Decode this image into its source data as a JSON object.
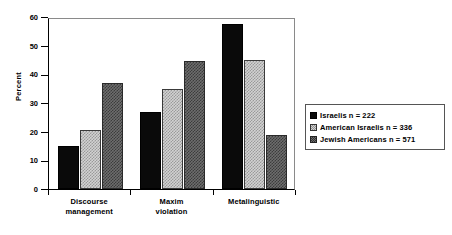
{
  "chart_data": {
    "type": "bar",
    "title": "",
    "subtitle": "",
    "xlabel": "",
    "ylabel": "Percent",
    "categories": [
      "Discourse\nmanagement",
      "Maxim\nviolation",
      "Metalinguistic"
    ],
    "category_lines": [
      [
        "Discourse",
        "management"
      ],
      [
        "Maxim",
        "violation"
      ],
      [
        "Metalinguistic"
      ]
    ],
    "series": [
      {
        "name": "Israelis  n = 222",
        "group": "Israelis",
        "n": 222,
        "values": [
          15,
          27,
          57.5
        ],
        "color": "#0a0a0a",
        "pattern": "solid-black"
      },
      {
        "name": "American  Israelis  n = 336",
        "group": "American Israelis",
        "n": 336,
        "values": [
          20.5,
          35,
          45
        ],
        "color": "#d2d2d2",
        "pattern": "light-checker"
      },
      {
        "name": "Jewish  Americans  n = 571",
        "group": "Jewish Americans",
        "n": 571,
        "values": [
          37,
          44.5,
          19
        ],
        "color": "#6d6d6d",
        "pattern": "dark-checker"
      }
    ],
    "ylim": [
      0,
      60
    ],
    "yticks": [
      0,
      10,
      20,
      30,
      40,
      50,
      60
    ],
    "ytick_labels": [
      "0",
      "10",
      "20",
      "30",
      "40",
      "50",
      "60"
    ],
    "grid": false,
    "legend_position": "right"
  },
  "legend": {
    "entries": [
      {
        "label": "Israelis  n = 222"
      },
      {
        "label": "American  Israelis  n = 336"
      },
      {
        "label": "Jewish  Americans  n = 571"
      }
    ]
  }
}
